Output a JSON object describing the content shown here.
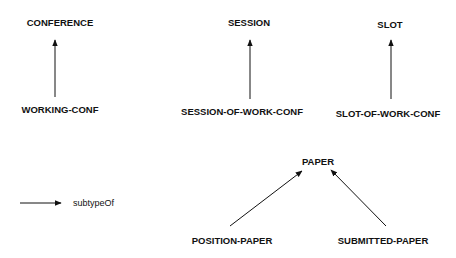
{
  "nodes": {
    "conference": "CONFERENCE",
    "working_conf": "WORKING-CONF",
    "session": "SESSION",
    "session_of_work_conf": "SESSION-OF-WORK-CONF",
    "slot": "SLOT",
    "slot_of_work_conf": "SLOT-OF-WORK-CONF",
    "paper": "PAPER",
    "position_paper": "POSITION-PAPER",
    "submitted_paper": "SUBMITTED-PAPER"
  },
  "edges": [
    {
      "from": "WORKING-CONF",
      "to": "CONFERENCE",
      "type": "subtypeOf"
    },
    {
      "from": "SESSION-OF-WORK-CONF",
      "to": "SESSION",
      "type": "subtypeOf"
    },
    {
      "from": "SLOT-OF-WORK-CONF",
      "to": "SLOT",
      "type": "subtypeOf"
    },
    {
      "from": "POSITION-PAPER",
      "to": "PAPER",
      "type": "subtypeOf"
    },
    {
      "from": "SUBMITTED-PAPER",
      "to": "PAPER",
      "type": "subtypeOf"
    }
  ],
  "legend": {
    "label": "subtypeOf"
  }
}
